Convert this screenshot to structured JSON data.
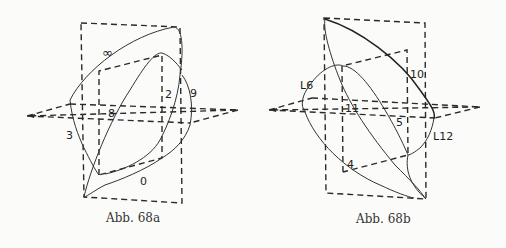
{
  "figures": [
    {
      "id": "68a",
      "caption": "Abb. 68a",
      "labels": {
        "infinity": "∞",
        "two": "2",
        "nine": "9",
        "eight": "8",
        "three": "3",
        "zero": "0"
      }
    },
    {
      "id": "68b",
      "caption": "Abb. 68b",
      "labels": {
        "l6": "L6",
        "ten": "10",
        "eleven": "11",
        "five": "5",
        "l12": "L12",
        "four": "4"
      }
    }
  ]
}
